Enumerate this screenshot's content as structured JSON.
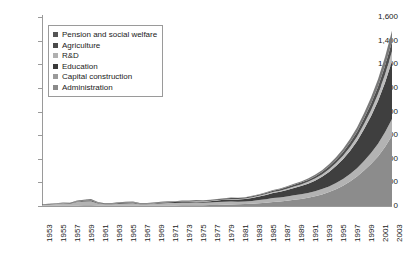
{
  "chart_data": {
    "type": "area",
    "stacked": true,
    "title": "",
    "subtitle": "",
    "xlabel": "",
    "ylabel": "",
    "grid": false,
    "legend_position": "top-left",
    "xlim": [
      1953,
      2003
    ],
    "ylim": [
      0,
      1600
    ],
    "ytick_step": 200,
    "ytick_labels": [
      "1,600",
      "1,400",
      "1,200",
      "1,000",
      "800",
      "600",
      "400",
      "200",
      "0"
    ],
    "ytick_values": [
      1600,
      1400,
      1200,
      1000,
      800,
      600,
      400,
      200,
      0
    ],
    "xtick_labels": [
      "1953",
      "1955",
      "1957",
      "1959",
      "1961",
      "1963",
      "1965",
      "1967",
      "1969",
      "1971",
      "1973",
      "1975",
      "1977",
      "1979",
      "1981",
      "1983",
      "1985",
      "1987",
      "1989",
      "1991",
      "1993",
      "1995",
      "1997",
      "1999",
      "2001",
      "2003"
    ],
    "x": [
      1953,
      1954,
      1955,
      1956,
      1957,
      1958,
      1959,
      1960,
      1961,
      1962,
      1963,
      1964,
      1965,
      1966,
      1967,
      1968,
      1969,
      1970,
      1971,
      1972,
      1973,
      1974,
      1975,
      1976,
      1977,
      1978,
      1979,
      1980,
      1981,
      1982,
      1983,
      1984,
      1985,
      1986,
      1987,
      1988,
      1989,
      1990,
      1991,
      1992,
      1993,
      1994,
      1995,
      1996,
      1997,
      1998,
      1999,
      2000,
      2001,
      2002,
      2003
    ],
    "series": [
      {
        "name": "Administration",
        "color": "#8c8c8c",
        "values": [
          2,
          2,
          3,
          4,
          4,
          5,
          6,
          7,
          5,
          4,
          4,
          5,
          5,
          5,
          4,
          4,
          4,
          4,
          5,
          5,
          6,
          6,
          7,
          7,
          8,
          9,
          11,
          13,
          14,
          16,
          19,
          23,
          27,
          33,
          38,
          44,
          52,
          60,
          70,
          82,
          98,
          118,
          142,
          172,
          208,
          250,
          300,
          355,
          420,
          500,
          595
        ]
      },
      {
        "name": "Capital construction",
        "color": "#b3b3b3",
        "values": [
          9,
          11,
          13,
          16,
          15,
          28,
          32,
          34,
          16,
          10,
          11,
          14,
          16,
          18,
          11,
          11,
          14,
          18,
          20,
          20,
          21,
          21,
          22,
          20,
          22,
          25,
          26,
          25,
          21,
          22,
          24,
          27,
          30,
          34,
          35,
          37,
          38,
          39,
          40,
          42,
          45,
          48,
          52,
          56,
          62,
          70,
          82,
          94,
          108,
          124,
          142
        ]
      },
      {
        "name": "Education",
        "color": "#3f3f3f",
        "values": [
          2,
          3,
          3,
          4,
          4,
          5,
          6,
          7,
          5,
          5,
          5,
          6,
          7,
          7,
          5,
          5,
          5,
          6,
          7,
          8,
          9,
          9,
          10,
          10,
          11,
          13,
          15,
          17,
          19,
          21,
          25,
          30,
          36,
          42,
          47,
          55,
          63,
          70,
          79,
          90,
          104,
          122,
          144,
          168,
          196,
          228,
          268,
          310,
          360,
          420,
          490
        ]
      },
      {
        "name": "R&D",
        "color": "#bdbdbd",
        "values": [
          0,
          1,
          1,
          1,
          1,
          2,
          2,
          3,
          2,
          1,
          1,
          2,
          2,
          2,
          1,
          1,
          2,
          2,
          2,
          2,
          3,
          3,
          3,
          3,
          3,
          4,
          4,
          5,
          5,
          5,
          6,
          7,
          8,
          9,
          10,
          11,
          13,
          14,
          16,
          18,
          20,
          23,
          26,
          30,
          34,
          39,
          45,
          52,
          60,
          70,
          82
        ]
      },
      {
        "name": "Agriculture",
        "color": "#4f4f4f",
        "values": [
          1,
          2,
          2,
          3,
          3,
          5,
          6,
          6,
          4,
          3,
          4,
          4,
          5,
          5,
          4,
          4,
          4,
          5,
          5,
          5,
          6,
          6,
          6,
          6,
          6,
          7,
          8,
          8,
          8,
          8,
          9,
          9,
          10,
          11,
          12,
          13,
          14,
          15,
          16,
          18,
          20,
          23,
          26,
          30,
          35,
          40,
          46,
          54,
          62,
          72,
          84
        ]
      },
      {
        "name": "Pension and social welfare",
        "color": "#7a7a7a",
        "values": [
          0,
          0,
          1,
          1,
          1,
          1,
          1,
          2,
          1,
          1,
          1,
          1,
          1,
          1,
          1,
          1,
          1,
          1,
          1,
          1,
          1,
          1,
          2,
          2,
          2,
          2,
          2,
          3,
          3,
          3,
          4,
          4,
          5,
          6,
          7,
          8,
          9,
          10,
          12,
          14,
          16,
          19,
          23,
          27,
          32,
          38,
          45,
          54,
          64,
          76,
          90
        ]
      }
    ],
    "totals_note": "values in billions of yuan"
  },
  "legend": {
    "items": [
      {
        "label": "Pension and social welfare",
        "color": "#555555"
      },
      {
        "label": "Agriculture",
        "color": "#4a4a4a"
      },
      {
        "label": "R&D",
        "color": "#b0b0b0"
      },
      {
        "label": "Education",
        "color": "#3a3a3a"
      },
      {
        "label": "Capital construction",
        "color": "#9a9a9a"
      },
      {
        "label": "Administration",
        "color": "#8a8a8a"
      }
    ]
  },
  "axes": {
    "y_labels": [
      "1,600",
      "1,400",
      "1,200",
      "1,000",
      "800",
      "600",
      "400",
      "200",
      "0"
    ],
    "x_labels": [
      "1953",
      "1955",
      "1957",
      "1959",
      "1961",
      "1963",
      "1965",
      "1967",
      "1969",
      "1971",
      "1973",
      "1975",
      "1977",
      "1979",
      "1981",
      "1983",
      "1985",
      "1987",
      "1989",
      "1991",
      "1993",
      "1995",
      "1997",
      "1999",
      "2001",
      "2003"
    ]
  },
  "colors": {
    "axis": "#9a9a9a",
    "text": "#1a1a1a",
    "background": "#ffffff"
  }
}
